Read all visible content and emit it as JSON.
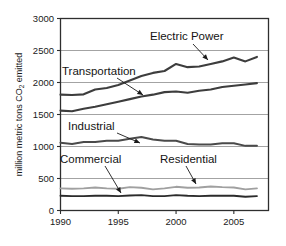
{
  "chart_data": {
    "type": "line",
    "title": "",
    "subtitle": "",
    "xlabel": "",
    "ylabel": "million metric tons CO2 emitted",
    "ylabel_main": "million metric tons CO",
    "ylabel_sub": "2",
    "ylabel_tail": " emitted",
    "xlim": [
      1990,
      2008
    ],
    "ylim": [
      0,
      3000
    ],
    "grid": true,
    "legend_position": "inline-annotations",
    "ytick_labels": [
      "3000",
      "2500",
      "2000",
      "1500",
      "1000",
      "500",
      "0"
    ],
    "ytick_values": [
      3000,
      2500,
      2000,
      1500,
      1000,
      500,
      0
    ],
    "xtick_labels": [
      "1990",
      "1995",
      "2000",
      "2005"
    ],
    "xtick_values": [
      1990,
      1995,
      2000,
      2005
    ],
    "x": [
      1990,
      1991,
      1992,
      1993,
      1994,
      1995,
      1996,
      1997,
      1998,
      1999,
      2000,
      2001,
      2002,
      2003,
      2004,
      2005,
      2006,
      2007
    ],
    "series": [
      {
        "name": "Electric Power",
        "color": "#3d3d3d",
        "width": 2.1,
        "values": [
          1810,
          1805,
          1815,
          1890,
          1915,
          1960,
          2030,
          2100,
          2150,
          2180,
          2290,
          2240,
          2250,
          2290,
          2330,
          2390,
          2330,
          2400
        ]
      },
      {
        "name": "Transportation",
        "color": "#3d3d3d",
        "width": 2.1,
        "values": [
          1560,
          1550,
          1590,
          1620,
          1660,
          1700,
          1740,
          1780,
          1810,
          1850,
          1860,
          1840,
          1870,
          1890,
          1930,
          1950,
          1970,
          1990
        ]
      },
      {
        "name": "Industrial",
        "color": "#4a4a4a",
        "width": 2.0,
        "values": [
          1060,
          1040,
          1070,
          1070,
          1090,
          1090,
          1120,
          1150,
          1110,
          1090,
          1090,
          1040,
          1030,
          1030,
          1050,
          1050,
          1010,
          1010
        ]
      },
      {
        "name": "Residential",
        "color": "#a0a0a0",
        "width": 1.9,
        "values": [
          345,
          340,
          345,
          360,
          345,
          340,
          365,
          355,
          330,
          345,
          370,
          355,
          360,
          375,
          365,
          360,
          330,
          345
        ]
      },
      {
        "name": "Commercial",
        "color": "#2b2b2b",
        "width": 1.9,
        "values": [
          230,
          225,
          225,
          230,
          230,
          225,
          235,
          240,
          225,
          225,
          240,
          230,
          225,
          230,
          230,
          230,
          215,
          225
        ]
      }
    ],
    "annotations": [
      {
        "label": "Electric Power",
        "text_x": 150,
        "text_y": 40,
        "anchor": "start",
        "arrow_from_x": 193,
        "arrow_from_y": 44,
        "arrow_to_x": 208,
        "arrow_to_y": 60
      },
      {
        "label": "Transportation",
        "text_x": 62,
        "text_y": 75,
        "anchor": "start",
        "arrow_from_x": 117,
        "arrow_from_y": 78,
        "arrow_to_x": 143,
        "arrow_to_y": 95
      },
      {
        "label": "Industrial",
        "text_x": 68,
        "text_y": 130,
        "anchor": "start",
        "arrow_from_x": 117,
        "arrow_from_y": 133,
        "arrow_to_x": 140,
        "arrow_to_y": 143
      },
      {
        "label": "Commercial",
        "text_x": 60,
        "text_y": 163,
        "anchor": "start",
        "arrow_from_x": 105,
        "arrow_from_y": 166,
        "arrow_to_x": 121,
        "arrow_to_y": 193
      },
      {
        "label": "Residential",
        "text_x": 160,
        "text_y": 163,
        "anchor": "start",
        "arrow_from_x": 186,
        "arrow_from_y": 166,
        "arrow_to_x": 196,
        "arrow_to_y": 184
      }
    ]
  }
}
